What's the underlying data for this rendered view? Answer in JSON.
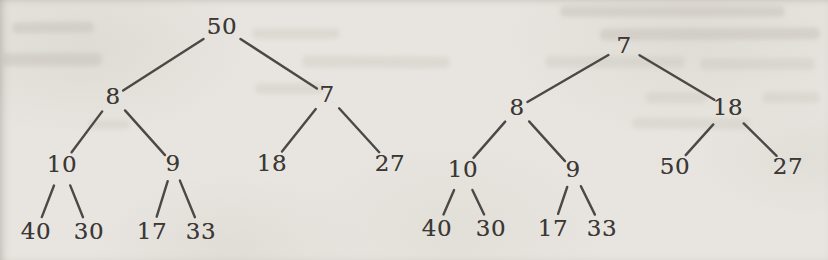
{
  "style": {
    "paper_color": "#e8e5e0",
    "ink_text_color": "#3b3835",
    "ink_line_color": "#4b4845",
    "edge_stroke_width": 2.4
  },
  "figure": {
    "trees": [
      {
        "name": "left-tree",
        "root_label": "50",
        "nodes": [
          {
            "label": "50",
            "x": 222,
            "y": 27
          },
          {
            "label": "8",
            "x": 113,
            "y": 97
          },
          {
            "label": "7",
            "x": 327,
            "y": 95
          },
          {
            "label": "10",
            "x": 62,
            "y": 165
          },
          {
            "label": "9",
            "x": 173,
            "y": 164
          },
          {
            "label": "18",
            "x": 272,
            "y": 164
          },
          {
            "label": "27",
            "x": 390,
            "y": 164
          },
          {
            "label": "40",
            "x": 36,
            "y": 232
          },
          {
            "label": "30",
            "x": 89,
            "y": 232
          },
          {
            "label": "17",
            "x": 152,
            "y": 232
          },
          {
            "label": "33",
            "x": 201,
            "y": 232
          }
        ],
        "edges": [
          [
            0,
            1
          ],
          [
            0,
            2
          ],
          [
            1,
            3
          ],
          [
            1,
            4
          ],
          [
            2,
            5
          ],
          [
            2,
            6
          ],
          [
            3,
            7
          ],
          [
            3,
            8
          ],
          [
            4,
            9
          ],
          [
            4,
            10
          ]
        ]
      },
      {
        "name": "right-tree",
        "root_label": "7",
        "nodes": [
          {
            "label": "7",
            "x": 624,
            "y": 46
          },
          {
            "label": "8",
            "x": 517,
            "y": 108
          },
          {
            "label": "18",
            "x": 728,
            "y": 108
          },
          {
            "label": "10",
            "x": 463,
            "y": 170
          },
          {
            "label": "9",
            "x": 573,
            "y": 170
          },
          {
            "label": "50",
            "x": 675,
            "y": 167
          },
          {
            "label": "27",
            "x": 788,
            "y": 167
          },
          {
            "label": "40",
            "x": 437,
            "y": 229
          },
          {
            "label": "30",
            "x": 491,
            "y": 229
          },
          {
            "label": "17",
            "x": 553,
            "y": 229
          },
          {
            "label": "33",
            "x": 602,
            "y": 229
          }
        ],
        "edges": [
          [
            0,
            1
          ],
          [
            0,
            2
          ],
          [
            1,
            3
          ],
          [
            1,
            4
          ],
          [
            2,
            5
          ],
          [
            2,
            6
          ],
          [
            3,
            7
          ],
          [
            3,
            8
          ],
          [
            4,
            9
          ],
          [
            4,
            10
          ]
        ]
      }
    ]
  }
}
